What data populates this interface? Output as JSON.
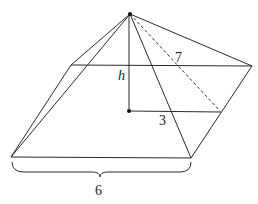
{
  "figure": {
    "labels": {
      "height": "h",
      "slant_height": "7",
      "half_base": "3",
      "base_side": "6"
    },
    "colors": {
      "stroke": "#2a2a2a",
      "text": "#222222",
      "background": "#ffffff"
    }
  }
}
